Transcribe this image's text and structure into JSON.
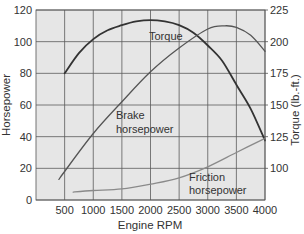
{
  "chart_data": {
    "type": "line",
    "title": "",
    "xlabel": "Engine RPM",
    "ylabel": "Horsepower",
    "y2label": "Torque (lb.-ft.)",
    "xlim": [
      0,
      4000
    ],
    "ylim": [
      0,
      120
    ],
    "y2lim": [
      75,
      225
    ],
    "grid": true,
    "legend": "inline labels",
    "x_ticks": [
      500,
      1000,
      1500,
      2000,
      2500,
      3000,
      3500,
      4000
    ],
    "y_ticks": [
      0,
      20,
      40,
      60,
      80,
      100,
      120
    ],
    "y2_ticks": [
      100,
      125,
      150,
      175,
      200,
      225
    ],
    "series": [
      {
        "name": "Torque",
        "axis": "right",
        "label": "Torque",
        "color": "#333333",
        "x": [
          500,
          750,
          1000,
          1250,
          1500,
          1750,
          2000,
          2250,
          2500,
          2750,
          3000,
          3250,
          3500,
          3750,
          4000
        ],
        "values": [
          175,
          191,
          202,
          209,
          213,
          216,
          217,
          216,
          213,
          207,
          197,
          185,
          166,
          147,
          122
        ]
      },
      {
        "name": "Brake horsepower",
        "axis": "left",
        "label": [
          "Brake",
          "horsepower"
        ],
        "color": "#555555",
        "x": [
          400,
          500,
          1000,
          1500,
          2000,
          2500,
          3000,
          3300,
          3500,
          3750,
          4000
        ],
        "values": [
          13,
          18,
          42,
          62,
          81,
          96,
          108,
          110,
          109,
          104,
          94
        ]
      },
      {
        "name": "Friction horsepower",
        "axis": "left",
        "label": [
          "Friction",
          "horsepower"
        ],
        "color": "#8a8a8a",
        "x": [
          650,
          1000,
          1500,
          2000,
          2500,
          3000,
          3500,
          4000
        ],
        "values": [
          5,
          6,
          7,
          10,
          14,
          21,
          30,
          39
        ]
      }
    ]
  },
  "labels": {
    "x_axis_title": "Engine RPM",
    "y_axis_title": "Horsepower",
    "y2_axis_title": "Torque (lb.-ft.)",
    "torque": "Torque",
    "brake_1": "Brake",
    "brake_2": "horsepower",
    "friction_1": "Friction",
    "friction_2": "horsepower"
  },
  "colors": {
    "plot_bg": "#e6e6e6",
    "grid": "#555555",
    "text": "#333333"
  }
}
